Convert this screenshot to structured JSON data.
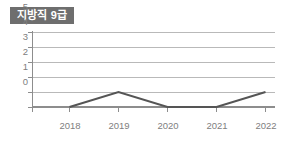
{
  "chart": {
    "title": "지방직 9급"
  },
  "chart_data": {
    "type": "line",
    "title": "지방직 9급",
    "xlabel": "",
    "ylabel": "",
    "categories": [
      "2018",
      "2019",
      "2020",
      "2021",
      "2022"
    ],
    "values": [
      0,
      1,
      0,
      0,
      1
    ],
    "series": [
      {
        "name": "지방직 9급",
        "values": [
          0,
          1,
          0,
          0,
          1
        ]
      }
    ],
    "x_tick_labels": [
      "2018",
      "2019",
      "2020",
      "2021",
      "2022"
    ],
    "y_tick_labels": [
      "5",
      "4",
      "3",
      "2",
      "1",
      "0"
    ],
    "y_ticks": [
      5,
      4,
      3,
      2,
      1,
      0
    ],
    "ylim": [
      0,
      5
    ],
    "grid": true,
    "legend": false,
    "legend_position": "none",
    "line_color": "#555555",
    "grid_color": "#b9b9b9",
    "axis_color": "#8d8d8d",
    "tick_label_color": "#808080",
    "title_background_color": "#6e6e6e",
    "title_text_color": "#ffffff",
    "background_color": "#ffffff"
  }
}
